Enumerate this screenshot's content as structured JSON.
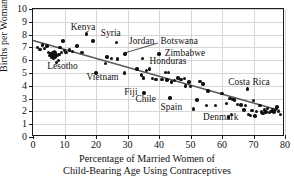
{
  "chart_data": {
    "type": "scatter",
    "title": "",
    "xlabel": "Percentage of Married Women of Child-Bearing Age Using Contraceptives",
    "xlabel_line1": "Percentage of Married Women of",
    "xlabel_line2": "Child-Bearing Age Using Contraceptives",
    "ylabel": "Births per Woman",
    "xlim": [
      0,
      80
    ],
    "ylim": [
      0,
      10
    ],
    "xticks": [
      0,
      10,
      20,
      30,
      40,
      50,
      60,
      70,
      80
    ],
    "yticks": [
      0,
      1,
      2,
      3,
      4,
      5,
      6,
      7,
      8,
      9,
      10
    ],
    "grid": true,
    "legend": "none",
    "point_color": "#111111",
    "trendline_color": "#595959",
    "gridline_color": "#d6d6d6",
    "trendline": {
      "x": [
        0,
        79
      ],
      "y": [
        7.5,
        1.95
      ],
      "slope": -0.0702,
      "intercept": 7.5
    },
    "points": [
      [
        1.5,
        7.0
      ],
      [
        2.2,
        6.85
      ],
      [
        3.0,
        7.2
      ],
      [
        3.6,
        6.9
      ],
      [
        4.4,
        7.1
      ],
      [
        5.0,
        6.6
      ],
      [
        5.4,
        6.35
      ],
      [
        5.7,
        6.5
      ],
      [
        5.9,
        6.2
      ],
      [
        6.1,
        6.45
      ],
      [
        6.3,
        6.3
      ],
      [
        6.4,
        6.6
      ],
      [
        6.6,
        6.15
      ],
      [
        6.8,
        6.4
      ],
      [
        6.9,
        6.7
      ],
      [
        7.0,
        6.25
      ],
      [
        7.2,
        6.55
      ],
      [
        7.4,
        5.8
      ],
      [
        7.6,
        6.35
      ],
      [
        8.0,
        6.0
      ],
      [
        8.3,
        6.45
      ],
      [
        8.6,
        7.0
      ],
      [
        9.0,
        6.6
      ],
      [
        9.5,
        7.5
      ],
      [
        10.0,
        6.75
      ],
      [
        10.5,
        6.6
      ],
      [
        11.5,
        6.8
      ],
      [
        12.5,
        6.7
      ],
      [
        14.0,
        7.1
      ],
      [
        15.5,
        6.6
      ],
      [
        17.0,
        8.05
      ],
      [
        19.0,
        7.5
      ],
      [
        20.0,
        5.0
      ],
      [
        23.0,
        5.75
      ],
      [
        23.5,
        6.25
      ],
      [
        25.0,
        6.15
      ],
      [
        26.5,
        7.4
      ],
      [
        26.8,
        6.1
      ],
      [
        29.0,
        5.0
      ],
      [
        29.2,
        6.5
      ],
      [
        33.0,
        5.3
      ],
      [
        34.5,
        4.85
      ],
      [
        34.8,
        6.15
      ],
      [
        35.0,
        4.6
      ],
      [
        35.2,
        3.45
      ],
      [
        36.0,
        5.2
      ],
      [
        37.0,
        5.3
      ],
      [
        38.0,
        4.55
      ],
      [
        39.0,
        4.5
      ],
      [
        40.0,
        6.5
      ],
      [
        41.0,
        4.5
      ],
      [
        42.0,
        5.05
      ],
      [
        42.5,
        4.45
      ],
      [
        43.0,
        5.05
      ],
      [
        43.5,
        3.05
      ],
      [
        44.0,
        4.3
      ],
      [
        45.0,
        4.4
      ],
      [
        46.0,
        4.6
      ],
      [
        47.0,
        4.5
      ],
      [
        48.0,
        4.55
      ],
      [
        48.5,
        4.0
      ],
      [
        49.5,
        4.3
      ],
      [
        50.0,
        3.95
      ],
      [
        51.0,
        2.2
      ],
      [
        52.0,
        2.9
      ],
      [
        53.0,
        4.35
      ],
      [
        54.0,
        4.15
      ],
      [
        55.0,
        2.45
      ],
      [
        55.5,
        3.6
      ],
      [
        58.0,
        2.45
      ],
      [
        60.0,
        3.4
      ],
      [
        61.5,
        2.6
      ],
      [
        62.0,
        1.55
      ],
      [
        62.5,
        3.0
      ],
      [
        63.0,
        1.75
      ],
      [
        63.5,
        2.95
      ],
      [
        64.0,
        2.9
      ],
      [
        65.0,
        2.55
      ],
      [
        66.0,
        2.5
      ],
      [
        67.0,
        2.1
      ],
      [
        67.5,
        2.45
      ],
      [
        68.0,
        3.75
      ],
      [
        68.5,
        1.75
      ],
      [
        69.0,
        1.7
      ],
      [
        69.5,
        2.05
      ],
      [
        70.0,
        2.85
      ],
      [
        70.5,
        1.65
      ],
      [
        71.0,
        2.0
      ],
      [
        72.0,
        2.45
      ],
      [
        72.5,
        1.95
      ],
      [
        73.0,
        1.85
      ],
      [
        73.5,
        2.1
      ],
      [
        74.0,
        1.95
      ],
      [
        74.5,
        2.25
      ],
      [
        75.0,
        1.9
      ],
      [
        75.5,
        2.0
      ],
      [
        76.0,
        2.1
      ],
      [
        76.5,
        1.95
      ],
      [
        77.0,
        2.15
      ],
      [
        77.5,
        2.35
      ],
      [
        78.0,
        2.0
      ],
      [
        78.5,
        1.75
      ]
    ],
    "annotations": [
      {
        "label": "Kenya",
        "x": 12.0,
        "y": 8.55,
        "align": "left"
      },
      {
        "label": "Syria",
        "x": 21.5,
        "y": 8.05,
        "align": "left"
      },
      {
        "label": "Jordan",
        "x": 30.5,
        "y": 7.45,
        "align": "left"
      },
      {
        "label": "Botswana",
        "x": 40.5,
        "y": 7.45,
        "align": "left"
      },
      {
        "label": "Zimbabwe",
        "x": 41.8,
        "y": 6.52,
        "align": "left"
      },
      {
        "label": "Honduras",
        "x": 37.0,
        "y": 5.85,
        "align": "left"
      },
      {
        "label": "Lesotho",
        "x": 4.5,
        "y": 5.45,
        "align": "left"
      },
      {
        "label": "Vietnam",
        "x": 17.0,
        "y": 4.6,
        "align": "left"
      },
      {
        "label": "Costa Rica",
        "x": 62.0,
        "y": 4.25,
        "align": "left"
      },
      {
        "label": "Fiji",
        "x": 29.0,
        "y": 3.45,
        "align": "left"
      },
      {
        "label": "Chile",
        "x": 32.5,
        "y": 2.9,
        "align": "left"
      },
      {
        "label": "Spain",
        "x": 40.5,
        "y": 2.25,
        "align": "left"
      },
      {
        "label": "Denmark",
        "x": 54.0,
        "y": 1.45,
        "align": "left"
      }
    ],
    "leader_lines": [
      {
        "label": "Botswana",
        "from_x": 40.0,
        "from_y": 7.3,
        "to_x": 29.2,
        "to_y": 6.5
      }
    ]
  }
}
